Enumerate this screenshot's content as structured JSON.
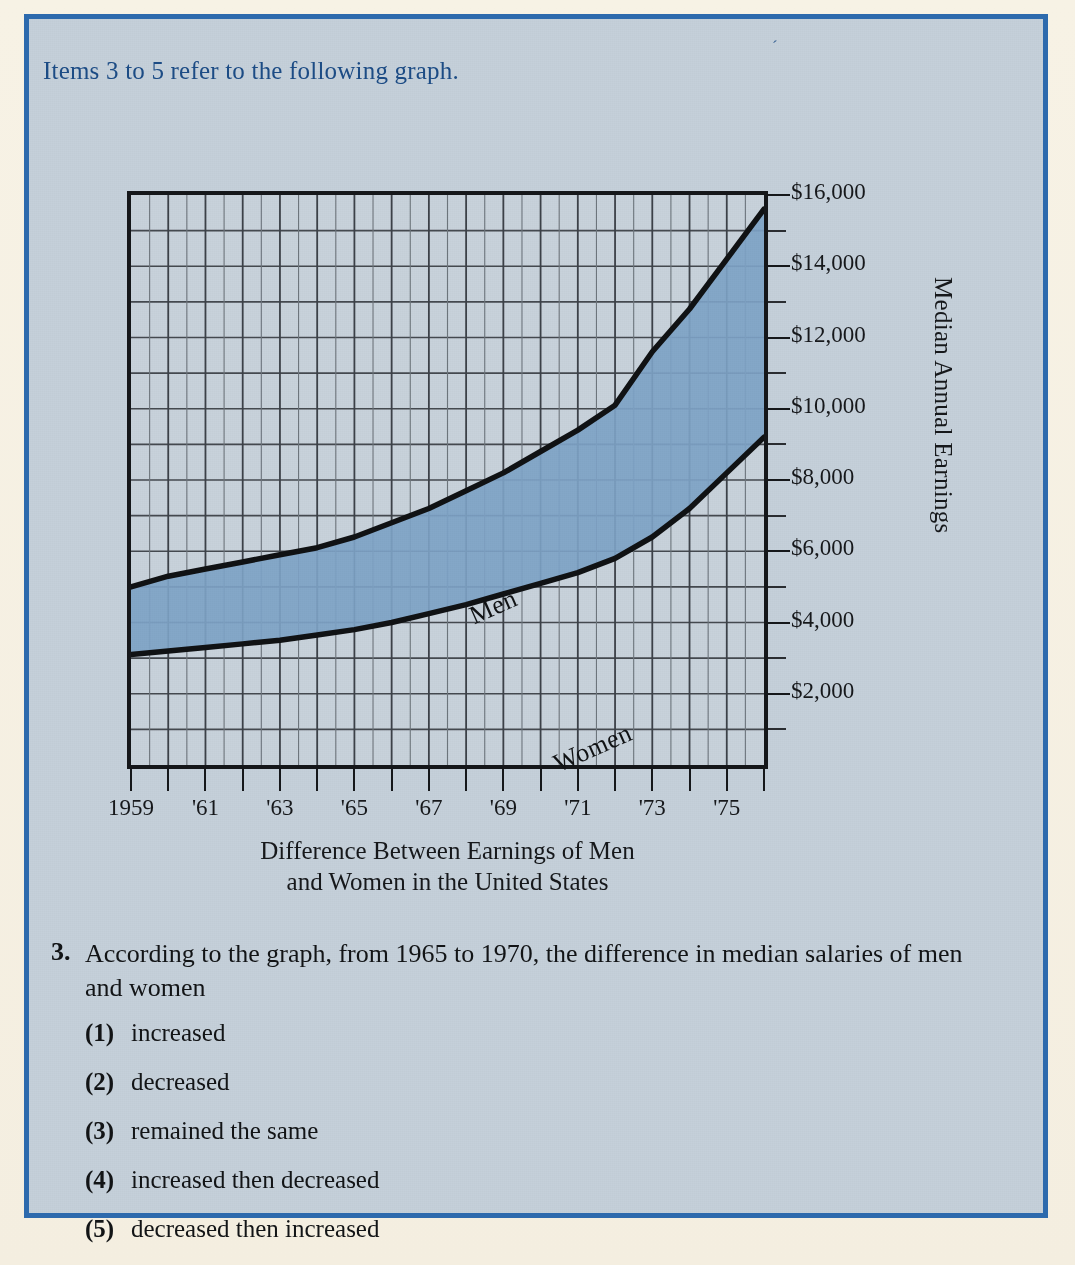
{
  "page": {
    "header_text": "Items 3 to 5 refer to the following graph.",
    "stray_mark": "´",
    "colors": {
      "paper": "#f6f1e3",
      "panel_bg": "#c5d0da",
      "panel_border": "#2d6aad",
      "header_text": "#1c4c86",
      "ink": "#16181b",
      "band_fill": "#7ea3c7"
    }
  },
  "chart_data": {
    "type": "area",
    "title": "Difference Between Earnings of Men and Women in the United States",
    "xlabel_line1": "Difference Between Earnings of Men",
    "xlabel_line2": "and Women in the United States",
    "ylabel": "Median Annual Earnings",
    "grid": true,
    "legend_position": "inline-on-curve",
    "xlim": [
      1959,
      1976
    ],
    "ylim": [
      0,
      16000
    ],
    "y_major_step": 2000,
    "y_minor_step": 1000,
    "ytick_labels": [
      "$16,000",
      "$14,000",
      "$12,000",
      "$10,000",
      "$8,000",
      "$6,000",
      "$4,000",
      "$2,000"
    ],
    "ytick_values": [
      16000,
      14000,
      12000,
      10000,
      8000,
      6000,
      4000,
      2000
    ],
    "xtick_labels": [
      "1959",
      "'61",
      "'63",
      "'65",
      "'67",
      "'69",
      "'71",
      "'73",
      "'75"
    ],
    "xtick_values": [
      1959,
      1961,
      1963,
      1965,
      1967,
      1969,
      1971,
      1973,
      1975
    ],
    "x": [
      1959,
      1960,
      1961,
      1962,
      1963,
      1964,
      1965,
      1966,
      1967,
      1968,
      1969,
      1970,
      1971,
      1972,
      1973,
      1974,
      1975,
      1976
    ],
    "series": [
      {
        "name": "Men",
        "label": "Men",
        "values": [
          5000,
          5300,
          5500,
          5700,
          5900,
          6100,
          6400,
          6800,
          7200,
          7700,
          8200,
          8800,
          9400,
          10100,
          11600,
          12800,
          14200,
          15600
        ]
      },
      {
        "name": "Women",
        "label": "Women",
        "values": [
          3100,
          3200,
          3300,
          3400,
          3500,
          3650,
          3800,
          4000,
          4250,
          4500,
          4800,
          5100,
          5400,
          5800,
          6400,
          7200,
          8200,
          9200
        ]
      }
    ],
    "band_note": "Shaded band between Men and Women curves"
  },
  "question": {
    "number": "3.",
    "stem": "According to the graph, from 1965 to 1970, the difference in median salaries of men and women",
    "choices": [
      {
        "num": "(1)",
        "text": "increased"
      },
      {
        "num": "(2)",
        "text": "decreased"
      },
      {
        "num": "(3)",
        "text": "remained the same"
      },
      {
        "num": "(4)",
        "text": "increased then decreased"
      },
      {
        "num": "(5)",
        "text": "decreased then increased"
      }
    ]
  }
}
